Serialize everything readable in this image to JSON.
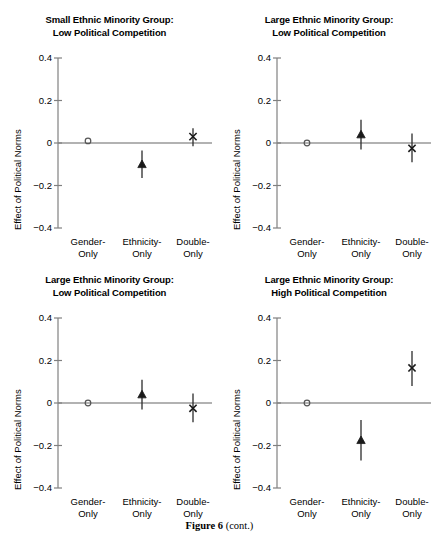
{
  "caption": {
    "bold": "Figure 6",
    "rest": " (cont.)"
  },
  "axis": {
    "ylabel": "Effect of Political Norms",
    "yticks": [
      "0.4",
      "0.2",
      "0",
      "−0.2",
      "−0.4"
    ],
    "ytick_values": [
      0.4,
      0.2,
      0,
      -0.2,
      -0.4
    ],
    "categories": [
      {
        "line1": "Gender-",
        "line2": "Only"
      },
      {
        "line1": "Ethnicity-",
        "line2": "Only"
      },
      {
        "line1": "Double-",
        "line2": "Only"
      }
    ]
  },
  "colors": {
    "axis": "#808080",
    "zero_line": "#999999",
    "marker": "#1a1a1a",
    "errorbar": "#2b2b2b",
    "text": "#000000",
    "background": "#ffffff"
  },
  "panels": [
    {
      "id": "panel-top-left",
      "title_line1": "Small Ethnic Minority Group:",
      "title_line2": "Low Political Competition"
    },
    {
      "id": "panel-top-right",
      "title_line1": "Large Ethnic Minority Group:",
      "title_line2": "Low Political Competition"
    },
    {
      "id": "panel-bottom-left",
      "title_line1": "Large Ethnic Minority Group:",
      "title_line2": "Low Political Competition"
    },
    {
      "id": "panel-bottom-right",
      "title_line1": "Large Ethnic Minority Group:",
      "title_line2": "High Political Competition"
    }
  ],
  "chart_data": [
    {
      "type": "scatter",
      "panel": "panel-top-left",
      "title": "Small Ethnic Minority Group: Low Political Competition",
      "xlabel": "",
      "ylabel": "Effect of Political Norms",
      "ylim": [
        -0.45,
        0.45
      ],
      "yticks": [
        -0.4,
        -0.2,
        0,
        0.2,
        0.4
      ],
      "grid": false,
      "legend": "none",
      "zero_reference_line": 0,
      "categories": [
        "Gender-Only",
        "Ethnicity-Only",
        "Double-Only"
      ],
      "points": [
        {
          "category": "Gender-Only",
          "value": 0.01,
          "ci_low": 0.01,
          "ci_high": 0.01,
          "marker": "circle"
        },
        {
          "category": "Ethnicity-Only",
          "value": -0.1,
          "ci_low": -0.165,
          "ci_high": -0.035,
          "marker": "triangle"
        },
        {
          "category": "Double-Only",
          "value": 0.03,
          "ci_low": -0.015,
          "ci_high": 0.07,
          "marker": "cross"
        }
      ]
    },
    {
      "type": "scatter",
      "panel": "panel-top-right",
      "title": "Large Ethnic Minority Group: Low Political Competition",
      "xlabel": "",
      "ylabel": "Effect of Political Norms",
      "ylim": [
        -0.45,
        0.45
      ],
      "yticks": [
        -0.4,
        -0.2,
        0,
        0.2,
        0.4
      ],
      "grid": false,
      "legend": "none",
      "zero_reference_line": 0,
      "categories": [
        "Gender-Only",
        "Ethnicity-Only",
        "Double-Only"
      ],
      "points": [
        {
          "category": "Gender-Only",
          "value": 0.0,
          "ci_low": 0.0,
          "ci_high": 0.0,
          "marker": "circle"
        },
        {
          "category": "Ethnicity-Only",
          "value": 0.04,
          "ci_low": -0.03,
          "ci_high": 0.11,
          "marker": "triangle"
        },
        {
          "category": "Double-Only",
          "value": -0.025,
          "ci_low": -0.09,
          "ci_high": 0.045,
          "marker": "cross"
        }
      ]
    },
    {
      "type": "scatter",
      "panel": "panel-bottom-left",
      "title": "Large Ethnic Minority Group: Low Political Competition",
      "xlabel": "",
      "ylabel": "Effect of Political Norms",
      "ylim": [
        -0.45,
        0.45
      ],
      "yticks": [
        -0.4,
        -0.2,
        0,
        0.2,
        0.4
      ],
      "grid": false,
      "legend": "none",
      "zero_reference_line": 0,
      "categories": [
        "Gender-Only",
        "Ethnicity-Only",
        "Double-Only"
      ],
      "points": [
        {
          "category": "Gender-Only",
          "value": 0.0,
          "ci_low": 0.0,
          "ci_high": 0.0,
          "marker": "circle"
        },
        {
          "category": "Ethnicity-Only",
          "value": 0.04,
          "ci_low": -0.03,
          "ci_high": 0.11,
          "marker": "triangle"
        },
        {
          "category": "Double-Only",
          "value": -0.025,
          "ci_low": -0.09,
          "ci_high": 0.045,
          "marker": "cross"
        }
      ]
    },
    {
      "type": "scatter",
      "panel": "panel-bottom-right",
      "title": "Large Ethnic Minority Group: High Political Competition",
      "xlabel": "",
      "ylabel": "Effect of Political Norms",
      "ylim": [
        -0.45,
        0.45
      ],
      "yticks": [
        -0.4,
        -0.2,
        0,
        0.2,
        0.4
      ],
      "grid": false,
      "legend": "none",
      "zero_reference_line": 0,
      "categories": [
        "Gender-Only",
        "Ethnicity-Only",
        "Double-Only"
      ],
      "points": [
        {
          "category": "Gender-Only",
          "value": 0.0,
          "ci_low": 0.0,
          "ci_high": 0.0,
          "marker": "circle"
        },
        {
          "category": "Ethnicity-Only",
          "value": -0.175,
          "ci_low": -0.27,
          "ci_high": -0.08,
          "marker": "triangle"
        },
        {
          "category": "Double-Only",
          "value": 0.165,
          "ci_low": 0.08,
          "ci_high": 0.245,
          "marker": "cross"
        }
      ]
    }
  ]
}
